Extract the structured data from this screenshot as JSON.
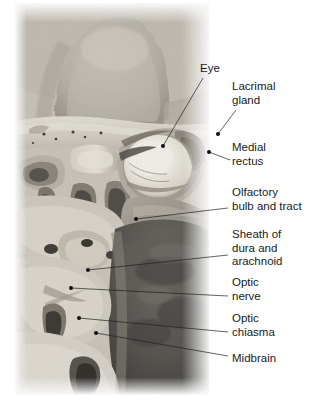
{
  "figure": {
    "number": "3.23"
  },
  "image": {
    "caption_alt": "Superior view of cranial base with orbit opened showing eye, optic nerves and brainstem",
    "colors": {
      "bone_light": "#e8e4dd",
      "bone_mid": "#cfc8bd",
      "tissue_mid": "#9a958e",
      "tissue_dark": "#5d5a57",
      "brain_dark": "#4a4845",
      "eyeball": "#f2efe8",
      "background": "#ffffff"
    }
  },
  "labels": [
    {
      "id": "eye",
      "text": "Eye",
      "x": 200,
      "y": 62,
      "anchor_x": 163,
      "anchor_y": 146,
      "line_start_x": 203,
      "line_start_y": 78,
      "dot": true
    },
    {
      "id": "lacrimal-gland",
      "text": "Lacrimal\ngland",
      "x": 232,
      "y": 80,
      "anchor_x": 218,
      "anchor_y": 134,
      "line_start_x": 236,
      "line_start_y": 110,
      "dot": true
    },
    {
      "id": "medial-rectus",
      "text": "Medial\nrectus",
      "x": 232,
      "y": 141,
      "anchor_x": 209,
      "anchor_y": 152,
      "line_start_x": 230,
      "line_start_y": 160,
      "dot": true
    },
    {
      "id": "olfactory-bulb-and-tract",
      "text": "Olfactory\nbulb and tract",
      "x": 232,
      "y": 186,
      "anchor_x": 136,
      "anchor_y": 219,
      "line_start_x": 228,
      "line_start_y": 208,
      "dot": true
    },
    {
      "id": "sheath-of-dura-and-arachnoid",
      "text": "Sheath of\ndura and\narachnoid",
      "x": 232,
      "y": 228,
      "anchor_x": 88,
      "anchor_y": 270,
      "line_start_x": 228,
      "line_start_y": 255,
      "dot": true
    },
    {
      "id": "optic-nerve",
      "text": "Optic\nnerve",
      "x": 232,
      "y": 276,
      "anchor_x": 71,
      "anchor_y": 288,
      "line_start_x": 228,
      "line_start_y": 296,
      "dot": true
    },
    {
      "id": "optic-chiasma",
      "text": "Optic\nchiasma",
      "x": 232,
      "y": 312,
      "anchor_x": 79,
      "anchor_y": 318,
      "line_start_x": 228,
      "line_start_y": 332,
      "dot": true
    },
    {
      "id": "midbrain",
      "text": "Midbrain",
      "x": 232,
      "y": 352,
      "anchor_x": 96,
      "anchor_y": 333,
      "line_start_x": 228,
      "line_start_y": 356,
      "dot": true
    }
  ]
}
